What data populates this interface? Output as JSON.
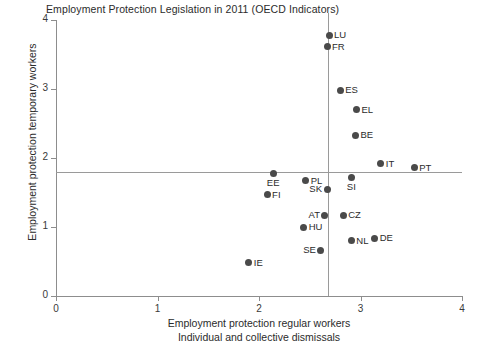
{
  "chart_data": {
    "type": "scatter",
    "title": "Employment Protection Legislation in 2011 (OECD Indicators)",
    "xlabel": "Employment protection regular workers",
    "xlabel_line2": "Individual and collective dismissals",
    "ylabel": "Employment protection temporary workers",
    "xlim": [
      0,
      4
    ],
    "ylim": [
      0,
      4
    ],
    "xticks": [
      "0",
      "1",
      "2",
      "3",
      "4"
    ],
    "yticks": [
      "0",
      "1",
      "2",
      "3",
      "4"
    ],
    "xtick_values": [
      0,
      1,
      2,
      3,
      4
    ],
    "ytick_values": [
      0,
      1,
      2,
      3,
      4
    ],
    "grid": false,
    "legend": "none",
    "marker_color": "#4a4a4a",
    "axis_color": "#8d8d8d",
    "reference_lines": [
      {
        "name": "mean-temporary-workers",
        "orientation": "horizontal",
        "value": 1.8,
        "color": "#9a9a9a"
      },
      {
        "name": "mean-regular-workers",
        "orientation": "vertical",
        "value": 2.68,
        "color": "#9a9a9a"
      }
    ],
    "points": [
      {
        "label": "LU",
        "x": 2.69,
        "y": 3.78,
        "label_pos": "right"
      },
      {
        "label": "FR",
        "x": 2.67,
        "y": 3.61,
        "label_pos": "right"
      },
      {
        "label": "ES",
        "x": 2.8,
        "y": 2.98,
        "label_pos": "right"
      },
      {
        "label": "EL",
        "x": 2.96,
        "y": 2.7,
        "label_pos": "right"
      },
      {
        "label": "BE",
        "x": 2.95,
        "y": 2.33,
        "label_pos": "right"
      },
      {
        "label": "IT",
        "x": 3.2,
        "y": 1.92,
        "label_pos": "right"
      },
      {
        "label": "PT",
        "x": 3.53,
        "y": 1.86,
        "label_pos": "right"
      },
      {
        "label": "SI",
        "x": 2.91,
        "y": 1.72,
        "label_pos": "below"
      },
      {
        "label": "PL",
        "x": 2.46,
        "y": 1.67,
        "label_pos": "right"
      },
      {
        "label": "EE",
        "x": 2.14,
        "y": 1.78,
        "label_pos": "below"
      },
      {
        "label": "SK",
        "x": 2.67,
        "y": 1.55,
        "label_pos": "left"
      },
      {
        "label": "FI",
        "x": 2.08,
        "y": 1.47,
        "label_pos": "right"
      },
      {
        "label": "AT",
        "x": 2.65,
        "y": 1.17,
        "label_pos": "left"
      },
      {
        "label": "CZ",
        "x": 2.83,
        "y": 1.17,
        "label_pos": "right"
      },
      {
        "label": "HU",
        "x": 2.44,
        "y": 1.0,
        "label_pos": "right"
      },
      {
        "label": "DE",
        "x": 3.14,
        "y": 0.84,
        "label_pos": "right"
      },
      {
        "label": "NL",
        "x": 2.91,
        "y": 0.8,
        "label_pos": "right"
      },
      {
        "label": "SE",
        "x": 2.61,
        "y": 0.66,
        "label_pos": "left"
      },
      {
        "label": "IE",
        "x": 1.9,
        "y": 0.48,
        "label_pos": "right"
      }
    ]
  }
}
